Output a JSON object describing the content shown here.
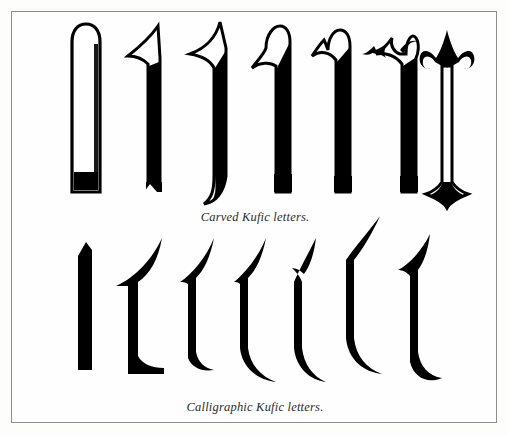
{
  "plate": {
    "title": "Kufic letterforms plate",
    "background_color": "#fefefe",
    "frame_color": "#8d8d8d",
    "ink_color": "#000000"
  },
  "sections": [
    {
      "id": "carved",
      "caption": "Carved Kufic letters.",
      "style": "outlined",
      "letter_count": 7,
      "letters": [
        {
          "name": "alif-plain-rounded-top",
          "description": "straight shaft, rounded top, flat base with shadow"
        },
        {
          "name": "alif-flared-left-serif",
          "description": "shaft with pointed flare to the left at top"
        },
        {
          "name": "alif-pointed-top-curved-tail",
          "description": "pointed top flare and curved tail at lower right"
        },
        {
          "name": "alif-wave-top",
          "description": "S-curved wave head leaning right"
        },
        {
          "name": "alif-bud-top",
          "description": "small hooked bud at the top left"
        },
        {
          "name": "alif-foliate-scroll",
          "description": "ornate foliate curl arching over the shaft"
        },
        {
          "name": "alif-symmetric-volutes",
          "description": "symmetric scrolls with central diamond and flared base"
        }
      ]
    },
    {
      "id": "calligraphic",
      "caption": "Calligraphic Kufic letters.",
      "style": "solid",
      "letter_count": 7,
      "letters": [
        {
          "name": "alif-slim-slanted-bar",
          "description": "narrow slanted solid bar, flat foot"
        },
        {
          "name": "alif-broad-concave",
          "description": "broad wedge, concave left edge, blunt foot"
        },
        {
          "name": "alif-wedge-short-tail",
          "description": "pointed head, short hooked foot"
        },
        {
          "name": "alif-wedge-swept-tail",
          "description": "pointed head with sweeping tail to the right"
        },
        {
          "name": "alif-narrow-swept",
          "description": "narrow shaft with long swept tail"
        },
        {
          "name": "alif-tall-thin-spur",
          "description": "tall thin shaft, fine spur head, curved tail"
        },
        {
          "name": "alif-hook-head-curl-foot",
          "description": "hooked head and curled foot"
        }
      ]
    }
  ]
}
